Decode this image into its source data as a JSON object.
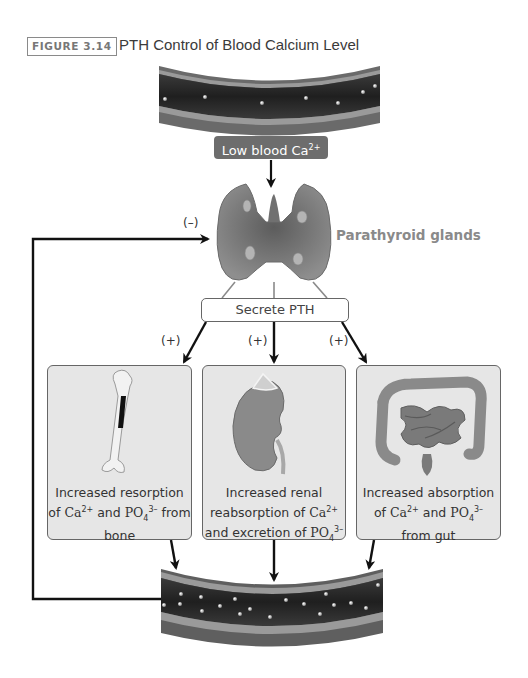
{
  "figure": {
    "number_label": "FIGURE 3.14",
    "title": "PTH Control of Blood Calcium Level"
  },
  "top_vessel": {
    "label": "Low blood Ca",
    "label_sup": "2+"
  },
  "gland": {
    "label": "Parathyroid glands",
    "feedback_sign": "(–)"
  },
  "secrete": {
    "label": "Secrete PTH",
    "signs": [
      "(+)",
      "(+)",
      "(+)"
    ]
  },
  "boxes": [
    {
      "organ": "bone",
      "line1": "Increased resorption",
      "line2_pre": "of ",
      "ion1": "Ca",
      "ion1_sup": "2+",
      "mid": " and ",
      "ion2": "PO",
      "ion2_sub": "4",
      "ion2_sup": "3–",
      "line2_post": " from",
      "line3": "bone"
    },
    {
      "organ": "kidney",
      "line1": "Increased renal",
      "line2_pre": "reabsorption of ",
      "ion1": "Ca",
      "ion1_sup": "2+",
      "line3_pre": "and excretion of ",
      "ion2": "PO",
      "ion2_sub": "4",
      "ion2_sup": "3–"
    },
    {
      "organ": "gut",
      "line1": "Increased absorption",
      "line2_pre": "of ",
      "ion1": "Ca",
      "ion1_sup": "2+",
      "mid": " and ",
      "ion2": "PO",
      "ion2_sub": "4",
      "ion2_sup": "3–",
      "line3": "from gut"
    }
  ],
  "colors": {
    "arrow": "#111111",
    "box_fill": "#e6e6e6",
    "pill_fill": "#6d6d6d",
    "vessel_dark": "#2b2b2b",
    "vessel_wall": "#8f8f8f",
    "gland": "#8c8c8c"
  }
}
